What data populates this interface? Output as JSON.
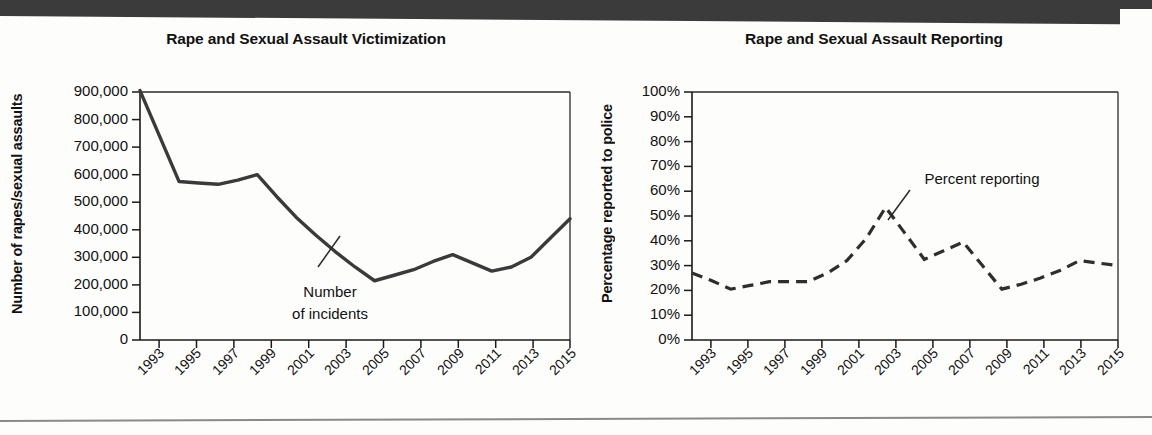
{
  "page": {
    "background_color": "#fdfdfc",
    "banner_color": "#3b3b3b"
  },
  "charts": {
    "left": {
      "title": "Rape and Sexual Assault Victimization",
      "ylabel": "Number of rapes/sexual assaults",
      "annotation_line1": "Number",
      "annotation_line2": "of incidents"
    },
    "right": {
      "title": "Rape and Sexual Assault Reporting",
      "ylabel": "Percentage reported to police",
      "annotation": "Percent reporting"
    }
  },
  "chart_data": [
    {
      "type": "line",
      "id": "victimization",
      "title": "Rape and Sexual Assault Victimization",
      "xlabel": "",
      "ylabel": "Number of rapes/sexual assaults",
      "series_name": "Number of incidents",
      "line_style": "solid",
      "line_color": "#3a3a3a",
      "grid": false,
      "legend": "none",
      "annotation": "Number of incidents",
      "ylim": [
        0,
        900000
      ],
      "ytick_labels": [
        "900,000",
        "800,000",
        "700,000",
        "600,000",
        "500,000",
        "400,000",
        "300,000",
        "200,000",
        "100,000",
        "0"
      ],
      "ytick_values": [
        900000,
        800000,
        700000,
        600000,
        500000,
        400000,
        300000,
        200000,
        100000,
        0
      ],
      "xtick_labels": [
        "1993",
        "1995",
        "1997",
        "1999",
        "2001",
        "2003",
        "2005",
        "2007",
        "2009",
        "2011",
        "2013",
        "2015"
      ],
      "x": [
        1993,
        1994,
        1995,
        1996,
        1997,
        1998,
        1999,
        2000,
        2001,
        2002,
        2003,
        2004,
        2005,
        2006,
        2007,
        2008,
        2009,
        2010,
        2011,
        2012,
        2013,
        2014,
        2015
      ],
      "values": [
        905000,
        740000,
        575000,
        570000,
        565000,
        580000,
        600000,
        520000,
        445000,
        380000,
        320000,
        265000,
        215000,
        235000,
        255000,
        285000,
        310000,
        280000,
        250000,
        265000,
        300000,
        370000,
        440000
      ]
    },
    {
      "type": "line",
      "id": "reporting",
      "title": "Rape and Sexual Assault Reporting",
      "xlabel": "",
      "ylabel": "Percentage reported to police",
      "series_name": "Percent reporting",
      "line_style": "dashed",
      "line_color": "#2e2e2e",
      "grid": false,
      "legend": "none",
      "annotation": "Percent reporting",
      "ylim": [
        0,
        100
      ],
      "ytick_labels": [
        "100%",
        "90%",
        "80%",
        "70%",
        "60%",
        "50%",
        "40%",
        "30%",
        "20%",
        "10%",
        "0%"
      ],
      "ytick_values": [
        100,
        90,
        80,
        70,
        60,
        50,
        40,
        30,
        20,
        10,
        0
      ],
      "xtick_labels": [
        "1993",
        "1995",
        "1997",
        "1999",
        "2001",
        "2003",
        "2005",
        "2007",
        "2009",
        "2011",
        "2013",
        "2015"
      ],
      "x": [
        1993,
        1994,
        1995,
        1996,
        1997,
        1998,
        1999,
        2000,
        2001,
        2002,
        2003,
        2004,
        2005,
        2006,
        2007,
        2008,
        2009,
        2010,
        2011,
        2012,
        2013,
        2014,
        2015
      ],
      "values": [
        27,
        24,
        20.5,
        22,
        23.5,
        23.5,
        23.5,
        27,
        32,
        41,
        53.5,
        43,
        32.5,
        36,
        39.5,
        30,
        20.5,
        22.5,
        25,
        28,
        32,
        31,
        30
      ]
    }
  ]
}
